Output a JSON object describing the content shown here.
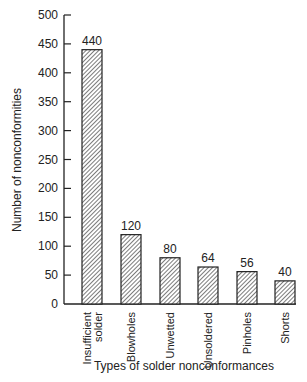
{
  "chart_data": {
    "type": "bar",
    "title": "",
    "xlabel": "Types of solder nonconformances",
    "ylabel": "Number of nonconformities",
    "categories": [
      "Insufficient solder",
      "Blowholes",
      "Unwetted",
      "Unsoldered",
      "Pinholes",
      "Shorts"
    ],
    "category_lines": [
      [
        "Insufficient",
        "solder"
      ],
      [
        "Blowholes"
      ],
      [
        "Unwetted"
      ],
      [
        "Unsoldered"
      ],
      [
        "Pinholes"
      ],
      [
        "Shorts"
      ]
    ],
    "values": [
      440,
      120,
      80,
      64,
      56,
      40
    ],
    "data_labels": [
      "440",
      "120",
      "80",
      "64",
      "56",
      "40"
    ],
    "ylim": [
      0,
      500
    ],
    "yticks": [
      0,
      50,
      100,
      150,
      200,
      250,
      300,
      350,
      400,
      450,
      500
    ],
    "grid": false,
    "legend": null,
    "bar_fill": "hatched",
    "colors": {
      "stroke": "#222222",
      "hatch": "#555555",
      "background": "#ffffff"
    }
  },
  "axes": {
    "x_title": "Types of solder nonconformances",
    "y_title": "Number of nonconformities"
  }
}
